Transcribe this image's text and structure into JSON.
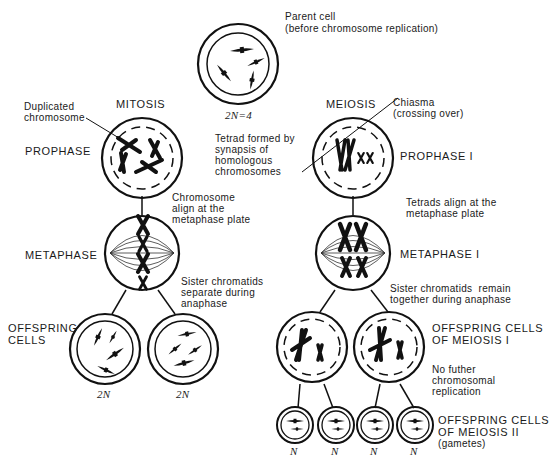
{
  "parent": {
    "label_line1": "Parent cell",
    "label_line2": "(before chromosome replication)",
    "ploidy": "2N=4"
  },
  "mitosis": {
    "title": "MITOSIS",
    "annotation_duplicated_1": "Duplicated",
    "annotation_duplicated_2": "chromosome",
    "stage_prophase": "PROPHASE",
    "note_align_1": "Chromosome",
    "note_align_2": "align at the",
    "note_align_3": "metaphase plate",
    "stage_metaphase": "METAPHASE",
    "note_separate_1": "Sister chromatids",
    "note_separate_2": "separate during",
    "note_separate_3": "anaphase",
    "stage_offspring_1": "OFFSPRING",
    "stage_offspring_2": "CELLS",
    "offspring_ploidy": [
      "2N",
      "2N"
    ]
  },
  "meiosis": {
    "title": "MEIOSIS",
    "annotation_chiasma_1": "Chiasma",
    "annotation_chiasma_2": "(crossing over)",
    "annotation_tetrad_1": "Tetrad formed by",
    "annotation_tetrad_2": "synapsis of",
    "annotation_tetrad_3": "homologous",
    "annotation_tetrad_4": "chromosomes",
    "stage_prophase": "PROPHASE I",
    "note_align_1": "Tetrads align at the",
    "note_align_2": "metaphase plate",
    "stage_metaphase": "METAPHASE I",
    "note_together_1": "Sister chromatids  remain",
    "note_together_2": "together during anaphase",
    "stage_offspring1_1": "OFFSPRING CELLS",
    "stage_offspring1_2": "OF MEIOSIS I",
    "note_noreplication_1": "No futher",
    "note_noreplication_2": "chromosomal",
    "note_noreplication_3": "replication",
    "stage_offspring2_1": "OFFSPRING CELLS",
    "stage_offspring2_2": "OF MEIOSIS II",
    "stage_offspring2_3": "(gametes)",
    "gamete_ploidy": [
      "N",
      "N",
      "N",
      "N"
    ]
  }
}
